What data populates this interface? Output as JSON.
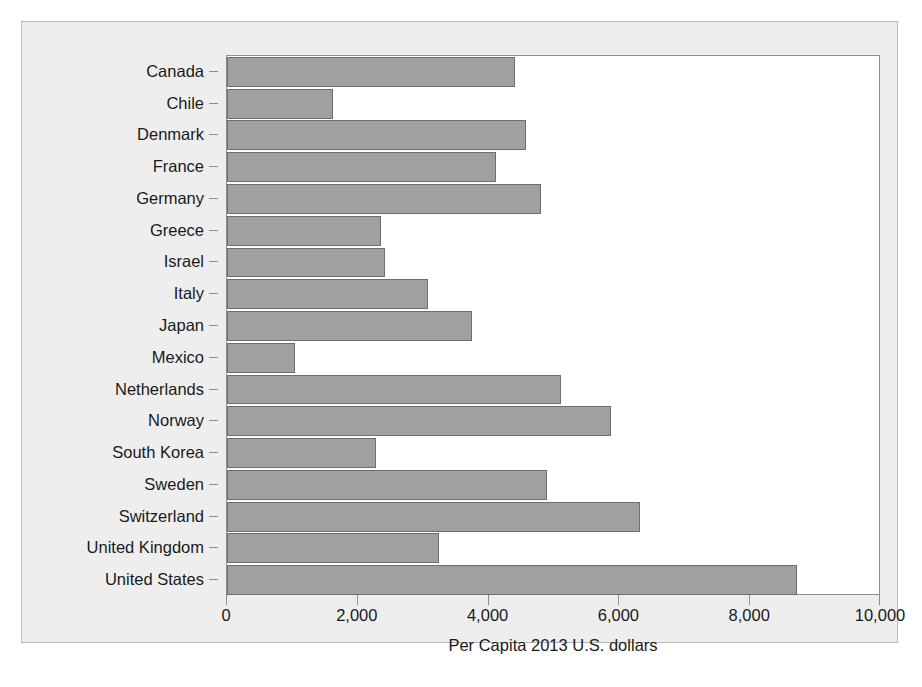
{
  "chart_data": {
    "type": "bar",
    "orientation": "horizontal",
    "title": "",
    "xlabel": "Per Capita 2013 U.S. dollars",
    "ylabel": "",
    "xlim": [
      0,
      10000
    ],
    "xticks": [
      0,
      2000,
      4000,
      6000,
      8000,
      10000
    ],
    "xtick_labels": [
      "0",
      "2,000",
      "4,000",
      "6,000",
      "8,000",
      "10,000"
    ],
    "grid": false,
    "legend": null,
    "bar_color": "#a0a0a0",
    "bar_edge_color": "#6e6e6e",
    "plot_background": "#ffffff",
    "figure_background": "#eeeeee",
    "categories": [
      "Canada",
      "Chile",
      "Denmark",
      "France",
      "Germany",
      "Greece",
      "Israel",
      "Italy",
      "Japan",
      "Mexico",
      "Netherlands",
      "Norway",
      "South Korea",
      "Sweden",
      "Switzerland",
      "United Kingdom",
      "United States"
    ],
    "values": [
      4400,
      1620,
      4570,
      4120,
      4800,
      2360,
      2420,
      3080,
      3740,
      1040,
      5110,
      5870,
      2280,
      4900,
      6320,
      3240,
      8710
    ]
  }
}
